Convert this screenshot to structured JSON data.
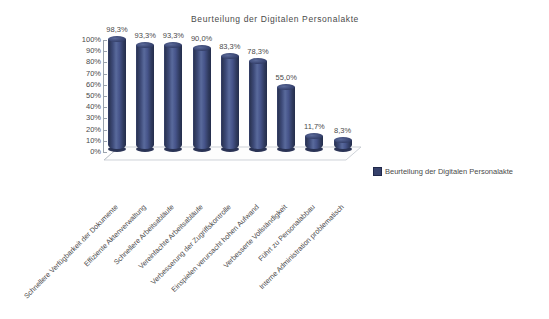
{
  "chart_data": {
    "type": "bar",
    "title": "Beurteilung der Digitalen Personalakte",
    "xlabel": "",
    "ylabel": "",
    "ylim": [
      0,
      100
    ],
    "grid": false,
    "legend_position": "right",
    "legend": [
      "Beurteilung der Digitalen Personalakte"
    ],
    "categories": [
      "Schnellere Verfügbarkeit der Dokumente",
      "Effiziente Aktenverwaltung",
      "Schnellere Arbeitsabläufe",
      "Vereinfachte Arbeitsabläufe",
      "Verbesserung der Zugriffskontrolle",
      "Einspielen verursacht hohen Aufwand",
      "Verbesserte Vollständigkeit",
      "Führt zu Personalabbau",
      "Interne Administration problematisch"
    ],
    "values": [
      98.3,
      93.3,
      93.3,
      90.0,
      83.3,
      78.3,
      55.0,
      11.7,
      8.3
    ],
    "value_labels": [
      "98,3%",
      "93,3%",
      "93,3%",
      "90,0%",
      "83,3%",
      "78,3%",
      "55,0%",
      "11,7%",
      "8,3%"
    ],
    "yticks": [
      100,
      90,
      80,
      70,
      60,
      50,
      40,
      30,
      20,
      10,
      0
    ],
    "ytick_labels": [
      "100%",
      "90%",
      "80%",
      "70%",
      "60%",
      "50%",
      "40%",
      "30%",
      "20%",
      "10%",
      "0%"
    ],
    "series_color": "#36416b"
  },
  "legend": {
    "label": "Beurteilung der Digitalen Personalakte"
  }
}
